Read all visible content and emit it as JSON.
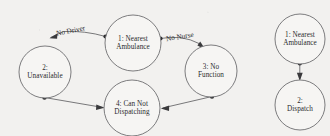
{
  "diagram": {
    "type": "state-transition-diagram",
    "background_color": "#f2f1ef",
    "node_fill": "#f6f5f3",
    "node_stroke": "#6e6e70",
    "edge_color": "#6a6a6c",
    "text_color": "#2b2b2d",
    "clusters": [
      {
        "id": "cluster-left",
        "name": "no-dispatch-cycle",
        "nodes": [
          {
            "id": "n1",
            "name": "nearest-ambulance",
            "label": "1: Nearest\nAmbulance",
            "cx": 133,
            "cy": 43,
            "r": 28
          },
          {
            "id": "n2",
            "name": "unavailable",
            "label": "2:\nUnavailable",
            "cx": 45,
            "cy": 72,
            "r": 26
          },
          {
            "id": "n3",
            "name": "no-function",
            "label": "3: No\nFunction",
            "cx": 211,
            "cy": 71,
            "r": 26
          },
          {
            "id": "n4",
            "name": "can-not-dispatching",
            "label": "4: Can Not\nDispatching",
            "cx": 132,
            "cy": 108,
            "r": 28
          }
        ],
        "edges": [
          {
            "id": "e1",
            "name": "edge-no-driver",
            "from": "n1",
            "to": "n2",
            "label": "No Driver",
            "label_x": 75,
            "label_y": 33,
            "label_rotate": -11
          },
          {
            "id": "e2",
            "name": "edge-no-nurse",
            "from": "n1",
            "to": "n3",
            "label": "No Nurse",
            "label_x": 184,
            "label_y": 40,
            "label_rotate": -9
          },
          {
            "id": "e3",
            "name": "edge-unavailable-to-dispatch",
            "from": "n2",
            "to": "n4",
            "label": ""
          },
          {
            "id": "e4",
            "name": "edge-nofunction-to-dispatch",
            "from": "n3",
            "to": "n4",
            "label": ""
          }
        ]
      },
      {
        "id": "cluster-right",
        "name": "dispatch-flow",
        "nodes": [
          {
            "id": "r1",
            "name": "nearest-ambulance-right",
            "label": "1: Nearest\nAmbulance",
            "cx": 300,
            "cy": 39,
            "r": 25
          },
          {
            "id": "r2",
            "name": "dispatch",
            "label": "2:\nDispatch",
            "cx": 300,
            "cy": 105,
            "r": 25
          }
        ],
        "edges": [
          {
            "id": "e5",
            "name": "edge-dispatch",
            "from": "r1",
            "to": "r2",
            "label": ""
          }
        ]
      }
    ]
  }
}
